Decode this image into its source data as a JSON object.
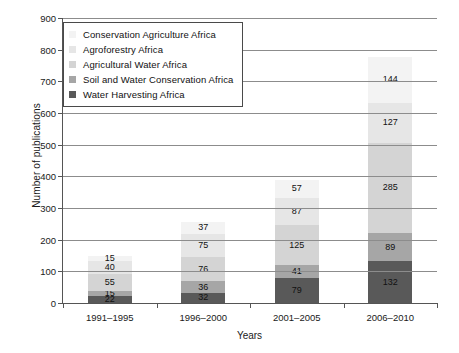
{
  "chart_data": {
    "type": "bar",
    "subtype": "stacked-bar",
    "title": "",
    "xlabel": "Years",
    "ylabel": "Number of publications",
    "ylim": [
      0,
      900
    ],
    "ytick_step": 100,
    "yticks": [
      0,
      100,
      200,
      300,
      400,
      500,
      600,
      700,
      800,
      900
    ],
    "grid": "horizontal",
    "legend_position": "top-left-inside",
    "categories": [
      "1991–1995",
      "1996–2000",
      "2001–2005",
      "2006–2010"
    ],
    "series": [
      {
        "name": "Water Harvesting Africa",
        "color": "#595959",
        "values": [
          22,
          32,
          79,
          132
        ]
      },
      {
        "name": "Soil and Water Conservation  Africa",
        "color": "#a6a6a6",
        "values": [
          15,
          36,
          41,
          89
        ]
      },
      {
        "name": "Agricultural Water Africa",
        "color": "#d4d4d4",
        "values": [
          55,
          76,
          125,
          285
        ]
      },
      {
        "name": "Agroforestry Africa",
        "color": "#e6e6e6",
        "values": [
          40,
          75,
          87,
          127
        ]
      },
      {
        "name": "Conservation Agriculture Africa",
        "color": "#f3f3f3",
        "values": [
          15,
          37,
          57,
          144
        ]
      }
    ],
    "totals": [
      147,
      256,
      389,
      777
    ]
  },
  "legend": {
    "items": [
      {
        "label": "Conservation Agriculture Africa",
        "color": "#f3f3f3"
      },
      {
        "label": "Agroforestry Africa",
        "color": "#e6e6e6"
      },
      {
        "label": "Agricultural Water Africa",
        "color": "#d4d4d4"
      },
      {
        "label": "Soil and Water Conservation  Africa",
        "color": "#a6a6a6"
      },
      {
        "label": "Water Harvesting Africa",
        "color": "#595959"
      }
    ]
  },
  "axes": {
    "y_title": "Number of publications",
    "x_title": "Years"
  }
}
